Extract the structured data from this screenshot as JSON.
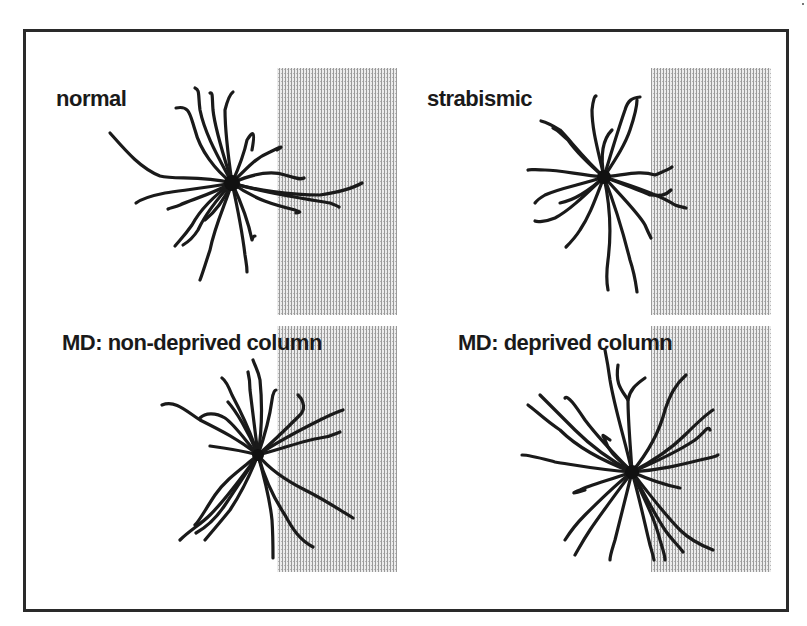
{
  "figure": {
    "type": "neuron-morphology-comparison",
    "frame": {
      "x": 23,
      "y": 29,
      "width": 763,
      "height": 580,
      "stroke": "#2a2a2a"
    },
    "column_shading": {
      "fill_base": "#e4e4e4",
      "line_color": "#8a8a8a"
    },
    "panels": [
      {
        "id": "normal",
        "label": "normal",
        "label_pos": {
          "x": 56,
          "y": 86
        },
        "column": {
          "x": 277,
          "y": 68,
          "width": 120,
          "height": 247
        },
        "soma": {
          "x": 232,
          "y": 183
        }
      },
      {
        "id": "strabismic",
        "label": "strabismic",
        "label_pos": {
          "x": 427,
          "y": 86
        },
        "column": {
          "x": 651,
          "y": 68,
          "width": 120,
          "height": 247
        },
        "soma": {
          "x": 604,
          "y": 177
        }
      },
      {
        "id": "md-non-deprived",
        "label": "MD: non-deprived column",
        "label_pos": {
          "x": 62,
          "y": 330
        },
        "column": {
          "x": 277,
          "y": 326,
          "width": 120,
          "height": 246
        },
        "soma": {
          "x": 258,
          "y": 455
        }
      },
      {
        "id": "md-deprived",
        "label": "MD: deprived column",
        "label_pos": {
          "x": 458,
          "y": 330
        },
        "column": {
          "x": 651,
          "y": 326,
          "width": 120,
          "height": 246
        },
        "soma": {
          "x": 632,
          "y": 472
        }
      }
    ]
  }
}
